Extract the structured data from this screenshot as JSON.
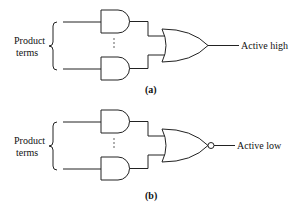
{
  "diagrams": [
    {
      "id": "a",
      "input_label_line1": "Product",
      "input_label_line2": "terms",
      "output_label": "Active high",
      "caption": "(a)",
      "output_gate": "OR",
      "inverted_output": false,
      "ellipsis": "⋮"
    },
    {
      "id": "b",
      "input_label_line1": "Product",
      "input_label_line2": "terms",
      "output_label": "Active low",
      "caption": "(b)",
      "output_gate": "NOR",
      "inverted_output": true,
      "ellipsis": "⋮"
    }
  ]
}
